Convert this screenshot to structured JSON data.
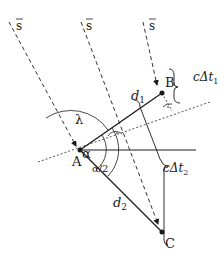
{
  "diagram": {
    "title": "",
    "signal_vector_label": "s",
    "signal_labels": [
      "s",
      "s",
      "s"
    ],
    "points": {
      "A": {
        "label": "A",
        "x": 80,
        "y": 150
      },
      "B": {
        "label": "B",
        "x": 162,
        "y": 93
      },
      "C": {
        "label": "C",
        "x": 162,
        "y": 232
      }
    },
    "distances": {
      "d1": {
        "base": "d",
        "sub": "1"
      },
      "d2": {
        "base": "d",
        "sub": "2"
      }
    },
    "angles": {
      "lambda": "λ",
      "alpha": "α",
      "alpha_half": "α/2"
    },
    "delays": {
      "dt1": {
        "prefix": "cΔt",
        "sub": "1"
      },
      "dt2": {
        "prefix": "cΔt",
        "sub": "2"
      }
    },
    "colors": {
      "line": "#1a1a1a",
      "dashed": "#333333",
      "dotted": "#555555"
    }
  }
}
